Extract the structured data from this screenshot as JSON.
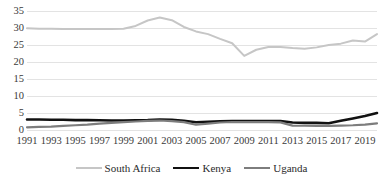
{
  "chart_data": {
    "type": "line",
    "title": "",
    "subtitle": "",
    "xlabel": "",
    "ylabel": "",
    "grid": true,
    "legend_position": "bottom",
    "ylim": [
      0,
      35
    ],
    "yticks": [
      0,
      5,
      10,
      15,
      20,
      25,
      30,
      35
    ],
    "xlim": [
      1991,
      2020
    ],
    "x": [
      1991,
      1992,
      1993,
      1994,
      1995,
      1996,
      1997,
      1998,
      1999,
      2000,
      2001,
      2002,
      2003,
      2004,
      2005,
      2006,
      2007,
      2008,
      2009,
      2010,
      2011,
      2012,
      2013,
      2014,
      2015,
      2016,
      2017,
      2018,
      2019,
      2020
    ],
    "xticks": [
      1991,
      1993,
      1995,
      1997,
      1999,
      2001,
      2003,
      2005,
      2007,
      2009,
      2011,
      2013,
      2015,
      2017,
      2019
    ],
    "xtick_labels": [
      "1991",
      "1993",
      "1995",
      "1997",
      "1999",
      "2001",
      "2003",
      "2005",
      "2007",
      "2009",
      "2011",
      "2013",
      "2015",
      "2017",
      "2019"
    ],
    "series": [
      {
        "name": "South Africa",
        "color": "#c6c6c6",
        "width": 2.0,
        "values": [
          29.9,
          29.8,
          29.8,
          29.7,
          29.7,
          29.7,
          29.7,
          29.7,
          29.8,
          30.6,
          32.2,
          33.1,
          32.3,
          30.3,
          29.0,
          28.2,
          26.8,
          25.5,
          21.8,
          23.6,
          24.4,
          24.4,
          24.1,
          23.9,
          24.3,
          25.0,
          25.4,
          26.3,
          26.0,
          28.2
        ]
      },
      {
        "name": "Kenya",
        "color": "#111111",
        "width": 2.6,
        "values": [
          3.1,
          3.1,
          3.0,
          3.0,
          2.9,
          2.9,
          2.85,
          2.8,
          2.8,
          2.85,
          2.9,
          3.05,
          3.0,
          2.7,
          2.3,
          2.4,
          2.55,
          2.6,
          2.6,
          2.6,
          2.6,
          2.6,
          2.2,
          2.1,
          2.1,
          2.0,
          2.7,
          3.4,
          4.1,
          5.0
        ]
      },
      {
        "name": "Uganda",
        "color": "#7d7d7d",
        "width": 2.2,
        "values": [
          0.8,
          0.9,
          1.0,
          1.2,
          1.4,
          1.6,
          1.9,
          2.1,
          2.3,
          2.5,
          2.7,
          2.8,
          2.6,
          2.3,
          1.55,
          1.9,
          2.2,
          2.35,
          2.3,
          2.3,
          2.3,
          2.25,
          1.3,
          1.25,
          1.2,
          1.2,
          1.3,
          1.4,
          1.6,
          1.95
        ]
      }
    ]
  }
}
